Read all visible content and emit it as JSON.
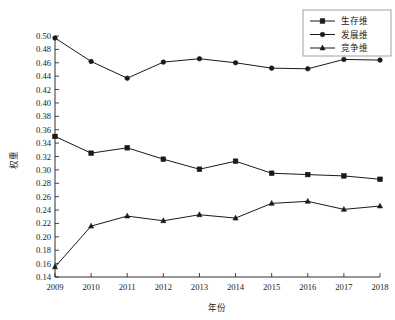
{
  "chart_data": {
    "type": "line",
    "title": "",
    "xlabel": "年份",
    "ylabel": "权重",
    "categories": [
      "2009",
      "2010",
      "2011",
      "2012",
      "2013",
      "2014",
      "2015",
      "2016",
      "2017",
      "2018"
    ],
    "x": [
      2009,
      2010,
      2011,
      2012,
      2013,
      2014,
      2015,
      2016,
      2017,
      2018
    ],
    "xlim": [
      2009,
      2018
    ],
    "ylim": [
      0.14,
      0.5
    ],
    "ytick_step": 0.02,
    "ytick_labels": [
      "0.14",
      "0.16",
      "0.18",
      "0.20",
      "0.22",
      "0.24",
      "0.26",
      "0.28",
      "0.30",
      "0.32",
      "0.34",
      "0.36",
      "0.38",
      "0.40",
      "0.42",
      "0.44",
      "0.46",
      "0.48",
      "0.50"
    ],
    "ytick_values": [
      0.14,
      0.16,
      0.18,
      0.2,
      0.22,
      0.24,
      0.26,
      0.28,
      0.3,
      0.32,
      0.34,
      0.36,
      0.38,
      0.4,
      0.42,
      0.44,
      0.46,
      0.48,
      0.5
    ],
    "grid": false,
    "legend_position": "top-right",
    "series": [
      {
        "name": "生存维",
        "marker": "square",
        "color": "#1a1a1a",
        "values": [
          0.35,
          0.325,
          0.333,
          0.316,
          0.301,
          0.313,
          0.295,
          0.293,
          0.291,
          0.286
        ]
      },
      {
        "name": "发展维",
        "marker": "circle",
        "color": "#1a1a1a",
        "values": [
          0.497,
          0.462,
          0.437,
          0.461,
          0.466,
          0.46,
          0.452,
          0.451,
          0.465,
          0.464
        ]
      },
      {
        "name": "竞争维",
        "marker": "triangle",
        "color": "#1a1a1a",
        "values": [
          0.155,
          0.216,
          0.231,
          0.224,
          0.233,
          0.228,
          0.25,
          0.253,
          0.241,
          0.246
        ]
      }
    ]
  },
  "legend": {
    "entries": [
      {
        "label": "生存维",
        "marker": "square"
      },
      {
        "label": "发展维",
        "marker": "circle"
      },
      {
        "label": "竞争维",
        "marker": "triangle"
      }
    ]
  },
  "axes": {
    "x_title": "年份",
    "y_title": "权重"
  }
}
